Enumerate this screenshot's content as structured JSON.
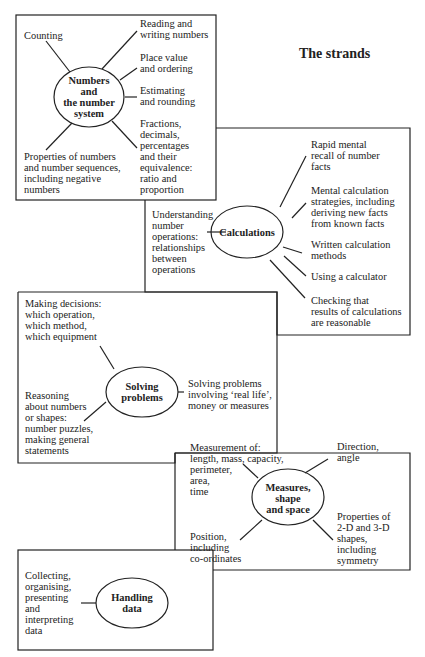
{
  "title": "The strands",
  "strands": [
    {
      "name": "Numbers\nand\nthe number\nsystem",
      "items": [
        "Counting",
        "Reading and\nwriting numbers",
        "Place value\nand ordering",
        "Estimating\nand rounding",
        "Fractions,\ndecimals,\npercentages\nand their\nequivalence:\nratio and\nproportion",
        "Properties of numbers\nand number sequences,\nincluding negative\nnumbers"
      ]
    },
    {
      "name": "Calculations",
      "items": [
        "Rapid mental\nrecall of number\nfacts",
        "Mental calculation\nstrategies, including\nderiving new facts\nfrom known facts",
        "Written calculation\nmethods",
        "Using a calculator",
        "Checking that\nresults of calculations\nare reasonable",
        "Understanding\nnumber\noperations:\nrelationships\nbetween\noperations"
      ]
    },
    {
      "name": "Solving\nproblems",
      "items": [
        "Making decisions:\nwhich operation,\nwhich method,\nwhich equipment",
        "Solving problems\ninvolving ‘real life’,\nmoney or measures",
        "Reasoning\nabout numbers\nor shapes:\nnumber puzzles,\nmaking general\nstatements"
      ]
    },
    {
      "name": "Measures,\nshape\nand space",
      "items": [
        "Measurement of:\nlength, mass, capacity,\nperimeter,\narea,\ntime",
        "Direction,\nangle",
        "Properties of\n2-D and 3-D\nshapes,\nincluding\nsymmetry",
        "Position,\nincluding\nco-ordinates"
      ]
    },
    {
      "name": "Handling\ndata",
      "items": [
        "Collecting,\norganising,\npresenting\nand\ninterpreting\ndata"
      ]
    }
  ]
}
